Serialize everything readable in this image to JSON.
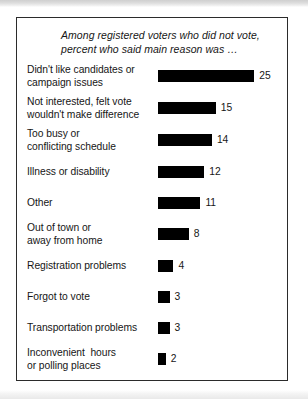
{
  "figure": {
    "title_line_1": "Among registered voters who did not vote,",
    "title_line_2": "percent who said main reason was …"
  },
  "chart_data": {
    "type": "bar",
    "orientation": "horizontal",
    "title": "Among registered voters who did not vote, percent who said main reason was …",
    "xlabel": "",
    "ylabel": "",
    "xlim": [
      0,
      25
    ],
    "grid": false,
    "legend": null,
    "value_suffix": "",
    "categories": [
      "Didn't like candidates or campaign issues",
      "Not interested, felt vote wouldn't make difference",
      "Too busy or conflicting schedule",
      "Illness or disability",
      "Other",
      "Out of town or away from home",
      "Registration problems",
      "Forgot to vote",
      "Transportation problems",
      "Inconvenient hours or polling places"
    ],
    "values": [
      25,
      15,
      14,
      12,
      11,
      8,
      4,
      3,
      3,
      2
    ],
    "bars": [
      {
        "label_lines": [
          "Didn't like candidates or",
          "campaign issues"
        ],
        "value": 25,
        "value_label": "25"
      },
      {
        "label_lines": [
          "Not interested, felt vote",
          "wouldn't make difference"
        ],
        "value": 15,
        "value_label": "15"
      },
      {
        "label_lines": [
          "Too busy or",
          "conflicting schedule"
        ],
        "value": 14,
        "value_label": "14"
      },
      {
        "label_lines": [
          "Illness or disability"
        ],
        "value": 12,
        "value_label": "12"
      },
      {
        "label_lines": [
          "Other"
        ],
        "value": 11,
        "value_label": "11"
      },
      {
        "label_lines": [
          "Out of town or",
          "away from home"
        ],
        "value": 8,
        "value_label": "8"
      },
      {
        "label_lines": [
          "Registration problems"
        ],
        "value": 4,
        "value_label": "4"
      },
      {
        "label_lines": [
          "Forgot to vote"
        ],
        "value": 3,
        "value_label": "3"
      },
      {
        "label_lines": [
          "Transportation problems"
        ],
        "value": 3,
        "value_label": "3"
      },
      {
        "label_lines": [
          "Inconvenient  hours",
          "or polling places"
        ],
        "value": 2,
        "value_label": "2"
      }
    ]
  },
  "style": {
    "bar_color": "#000000",
    "text_color": "#161616",
    "border_color": "#2b2b2b",
    "background": "#ffffff",
    "px_per_unit": 3.85
  }
}
